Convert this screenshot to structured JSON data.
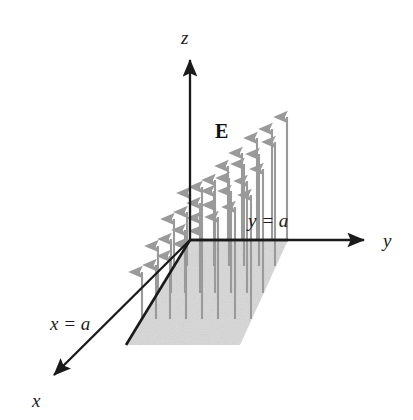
{
  "figure": {
    "kind": "physics-vector-field-diagram",
    "width": 413,
    "height": 420,
    "background_color": "#ffffff"
  },
  "axes": {
    "origin": {
      "x": 190,
      "y": 240
    },
    "items": [
      {
        "name": "z",
        "label": "z",
        "label_position": {
          "x": 181,
          "y": 28
        },
        "tip": {
          "x": 190,
          "y": 52
        },
        "color": "#1a1a1a"
      },
      {
        "name": "y",
        "label": "y",
        "label_position": {
          "x": 383,
          "y": 231
        },
        "tip": {
          "x": 370,
          "y": 240
        },
        "color": "#1a1a1a"
      },
      {
        "name": "x",
        "label": "x",
        "label_position": {
          "x": 32,
          "y": 391
        },
        "tip": {
          "x": 48,
          "y": 382
        },
        "color": "#1a1a1a"
      }
    ]
  },
  "annotations": [
    {
      "name": "x-boundary",
      "text": "x = a",
      "position": {
        "x": 50,
        "y": 314
      }
    },
    {
      "name": "y-boundary",
      "text": "y = a",
      "position": {
        "x": 248,
        "y": 211
      }
    },
    {
      "name": "field-vector-symbol",
      "text": "E",
      "position": {
        "x": 215,
        "y": 121
      },
      "bold": true
    }
  ],
  "surface": {
    "name": "square-surface-in-xy-plane",
    "shape": "parallelogram",
    "fill_color": "#d6d6d6",
    "edge_color": "#1a1a1a",
    "corners": [
      {
        "x": 190,
        "y": 240
      },
      {
        "x": 288,
        "y": 240
      },
      {
        "x": 240,
        "y": 345
      },
      {
        "x": 126,
        "y": 345
      }
    ],
    "solid_edges": [
      [
        {
          "x": 190,
          "y": 240
        },
        {
          "x": 288,
          "y": 240
        }
      ],
      [
        {
          "x": 190,
          "y": 240
        },
        {
          "x": 126,
          "y": 345
        }
      ]
    ]
  },
  "chart_data": {
    "type": "scatter",
    "title": "",
    "xlabel": "x",
    "ylabel": "y",
    "zlabel": "z",
    "grid": false,
    "legend_position": "none",
    "arrow_color": "#9a9a9a",
    "arrow_rows": [
      {
        "row": 0,
        "depth_fraction": 0.0,
        "base": {
          "x": 190,
          "y": 240
        },
        "arrows": [
          {
            "x": 190,
            "base_y": 240,
            "tip_y": 186,
            "length": 54
          },
          {
            "x": 202,
            "base_y": 240,
            "tip_y": 180,
            "length": 60
          },
          {
            "x": 215,
            "base_y": 240,
            "tip_y": 173,
            "length": 67
          },
          {
            "x": 228,
            "base_y": 240,
            "tip_y": 159,
            "length": 81
          },
          {
            "x": 242,
            "base_y": 240,
            "tip_y": 146,
            "length": 94
          },
          {
            "x": 257,
            "base_y": 240,
            "tip_y": 131,
            "length": 109
          },
          {
            "x": 272,
            "base_y": 240,
            "tip_y": 122,
            "length": 118
          },
          {
            "x": 287,
            "base_y": 240,
            "tip_y": 110,
            "length": 130
          }
        ]
      },
      {
        "row": 1,
        "depth_fraction": 0.25,
        "base": {
          "x": 174,
          "y": 266
        },
        "arrows": [
          {
            "x": 174,
            "base_y": 266,
            "tip_y": 212,
            "length": 54
          },
          {
            "x": 187,
            "base_y": 266,
            "tip_y": 205,
            "length": 61
          },
          {
            "x": 200,
            "base_y": 266,
            "tip_y": 196,
            "length": 70
          },
          {
            "x": 214,
            "base_y": 266,
            "tip_y": 184,
            "length": 82
          },
          {
            "x": 229,
            "base_y": 266,
            "tip_y": 171,
            "length": 95
          },
          {
            "x": 244,
            "base_y": 266,
            "tip_y": 157,
            "length": 109
          },
          {
            "x": 259,
            "base_y": 266,
            "tip_y": 147,
            "length": 119
          },
          {
            "x": 275,
            "base_y": 266,
            "tip_y": 135,
            "length": 131
          }
        ]
      },
      {
        "row": 2,
        "depth_fraction": 0.5,
        "base": {
          "x": 158,
          "y": 293
        },
        "arrows": [
          {
            "x": 158,
            "base_y": 293,
            "tip_y": 239,
            "length": 54
          },
          {
            "x": 171,
            "base_y": 293,
            "tip_y": 232,
            "length": 61
          },
          {
            "x": 185,
            "base_y": 293,
            "tip_y": 223,
            "length": 70
          },
          {
            "x": 200,
            "base_y": 293,
            "tip_y": 211,
            "length": 82
          },
          {
            "x": 215,
            "base_y": 293,
            "tip_y": 198,
            "length": 95
          },
          {
            "x": 231,
            "base_y": 293,
            "tip_y": 184,
            "length": 109
          },
          {
            "x": 247,
            "base_y": 293,
            "tip_y": 174,
            "length": 119
          },
          {
            "x": 263,
            "base_y": 293,
            "tip_y": 162,
            "length": 131
          }
        ]
      },
      {
        "row": 3,
        "depth_fraction": 0.75,
        "base": {
          "x": 142,
          "y": 319
        },
        "arrows": [
          {
            "x": 142,
            "base_y": 319,
            "tip_y": 265,
            "length": 54
          },
          {
            "x": 156,
            "base_y": 319,
            "tip_y": 258,
            "length": 61
          },
          {
            "x": 170,
            "base_y": 319,
            "tip_y": 249,
            "length": 70
          },
          {
            "x": 186,
            "base_y": 319,
            "tip_y": 237,
            "length": 82
          },
          {
            "x": 202,
            "base_y": 319,
            "tip_y": 224,
            "length": 95
          },
          {
            "x": 218,
            "base_y": 319,
            "tip_y": 210,
            "length": 109
          },
          {
            "x": 235,
            "base_y": 319,
            "tip_y": 200,
            "length": 119
          },
          {
            "x": 251,
            "base_y": 319,
            "tip_y": 188,
            "length": 131
          }
        ]
      }
    ]
  }
}
